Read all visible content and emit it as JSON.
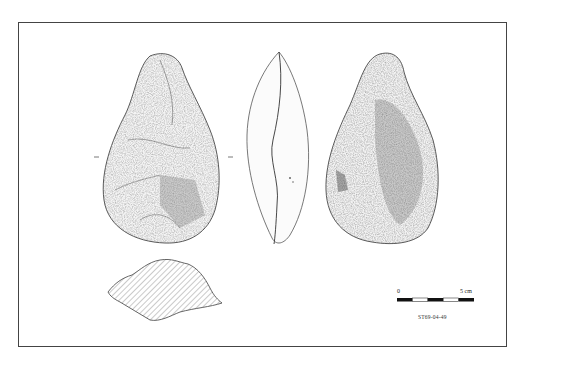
{
  "figure": {
    "views": [
      {
        "name": "dorsal-face",
        "label": ""
      },
      {
        "name": "lateral-profile",
        "label": ""
      },
      {
        "name": "ventral-face",
        "label": ""
      },
      {
        "name": "cross-section",
        "label": ""
      }
    ],
    "scale_bar": {
      "start_label": "0",
      "end_label": "5 cm",
      "segments": 5
    },
    "specimen_id": "ST69-04-49"
  },
  "colors": {
    "ink": "#333333",
    "frame": "#444444",
    "background": "#ffffff"
  }
}
